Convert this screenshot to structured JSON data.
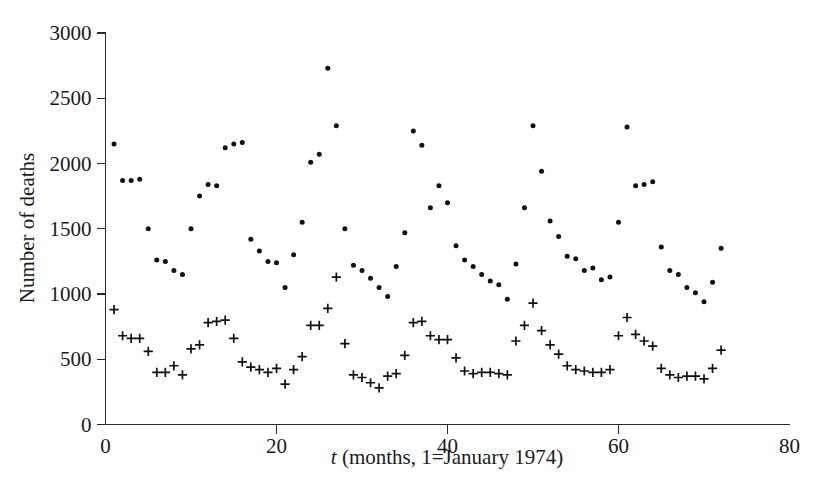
{
  "figure": {
    "background": "#ffffff",
    "ink_color": "#111111",
    "width": 829,
    "height": 502
  },
  "axes": {
    "x_title_prefix": "t",
    "x_title_rest": " (months, 1=January 1974)",
    "x_title_full": "t (months, 1=January 1974)",
    "y_title": "Number of deaths",
    "x_ticks": [
      0,
      20,
      40,
      60,
      80
    ],
    "y_ticks": [
      0,
      500,
      1000,
      1500,
      2000,
      2500,
      3000
    ],
    "x_tick_labels": [
      "0",
      "20",
      "40",
      "60",
      "80"
    ],
    "y_tick_labels": [
      "0",
      "500",
      "1000",
      "1500",
      "2000",
      "2500",
      "3000"
    ]
  },
  "chart_data": {
    "type": "scatter",
    "title": "",
    "xlabel": "t (months, 1=January 1974)",
    "ylabel": "Number of deaths",
    "xlim": [
      0,
      80
    ],
    "ylim": [
      0,
      3000
    ],
    "grid": false,
    "legend": "none",
    "marker_styles": {
      "drivers_killed": "dot",
      "front_seat_passengers_killed": "plus"
    },
    "series": [
      {
        "name": "drivers_killed",
        "marker": "dot",
        "x": [
          1,
          2,
          3,
          4,
          5,
          6,
          7,
          8,
          9,
          10,
          11,
          12,
          13,
          14,
          15,
          16,
          17,
          18,
          19,
          20,
          21,
          22,
          23,
          24,
          25,
          26,
          27,
          28,
          29,
          30,
          31,
          32,
          33,
          34,
          35,
          36,
          37,
          38,
          39,
          40,
          41,
          42,
          43,
          44,
          45,
          46,
          47,
          48,
          49,
          50,
          51,
          52,
          53,
          54,
          55,
          56,
          57,
          58,
          59,
          60,
          61,
          62,
          63,
          64,
          65,
          66,
          67,
          68,
          69,
          70,
          71,
          72
        ],
        "values": [
          2150,
          1870,
          1870,
          1880,
          1500,
          1260,
          1250,
          1180,
          1150,
          1500,
          1750,
          1840,
          1830,
          2120,
          2150,
          2160,
          1420,
          1330,
          1250,
          1240,
          1050,
          1300,
          1550,
          2010,
          2070,
          2730,
          2290,
          1500,
          1220,
          1180,
          1120,
          1050,
          980,
          1210,
          1470,
          2250,
          2140,
          1660,
          1830,
          1700,
          1370,
          1260,
          1210,
          1150,
          1100,
          1070,
          960,
          1230,
          1660,
          2290,
          1940,
          1560,
          1440,
          1290,
          1270,
          1180,
          1200,
          1110,
          1130,
          1550,
          2280,
          1830,
          1840,
          1860,
          1360,
          1180,
          1150,
          1050,
          1010,
          940,
          1090,
          1350
        ]
      },
      {
        "name": "front_seat_passengers_killed",
        "marker": "plus",
        "x": [
          1,
          2,
          3,
          4,
          5,
          6,
          7,
          8,
          9,
          10,
          11,
          12,
          13,
          14,
          15,
          16,
          17,
          18,
          19,
          20,
          21,
          22,
          23,
          24,
          25,
          26,
          27,
          28,
          29,
          30,
          31,
          32,
          33,
          34,
          35,
          36,
          37,
          38,
          39,
          40,
          41,
          42,
          43,
          44,
          45,
          46,
          47,
          48,
          49,
          50,
          51,
          52,
          53,
          54,
          55,
          56,
          57,
          58,
          59,
          60,
          61,
          62,
          63,
          64,
          65,
          66,
          67,
          68,
          69,
          70,
          71,
          72
        ],
        "values": [
          880,
          680,
          660,
          660,
          560,
          400,
          400,
          450,
          380,
          580,
          610,
          780,
          790,
          800,
          660,
          480,
          440,
          420,
          400,
          430,
          310,
          420,
          520,
          760,
          760,
          890,
          1130,
          620,
          380,
          360,
          320,
          280,
          370,
          390,
          530,
          780,
          790,
          680,
          650,
          650,
          510,
          410,
          390,
          400,
          400,
          390,
          380,
          640,
          760,
          930,
          720,
          610,
          540,
          450,
          420,
          410,
          400,
          400,
          420,
          680,
          820,
          690,
          640,
          600,
          430,
          380,
          360,
          370,
          370,
          350,
          430,
          570
        ]
      }
    ]
  }
}
